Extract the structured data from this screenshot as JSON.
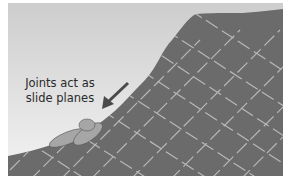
{
  "diagram": {
    "annotation": {
      "line1": "Joints act as",
      "line2": "slide planes"
    },
    "elements": [
      "sky-background",
      "rock-slope",
      "joint-lines",
      "sliding-blocks",
      "slide-direction-arrow"
    ],
    "colors": {
      "sky_top": "#cfcfcf",
      "sky_bottom": "#f2f2f2",
      "rock": "#6b6b6b",
      "joints": "#b8b8b8",
      "blocks": "#a6a6a6",
      "arrow": "#4a4a4a"
    }
  }
}
